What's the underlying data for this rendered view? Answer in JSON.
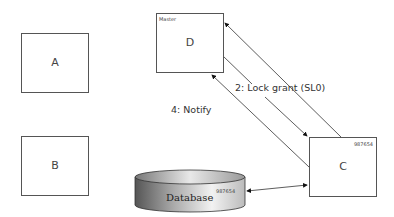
{
  "nodes": {
    "a": {
      "label": "A"
    },
    "b": {
      "label": "B"
    },
    "d": {
      "label": "D",
      "tag": "Master"
    },
    "c": {
      "label": "C",
      "tag": "987654"
    },
    "database": {
      "label": "Database",
      "tag": "987654"
    }
  },
  "edges": {
    "lock_grant": {
      "label": "2: Lock grant (SL0)"
    },
    "notify": {
      "label": "4: Notify"
    }
  }
}
